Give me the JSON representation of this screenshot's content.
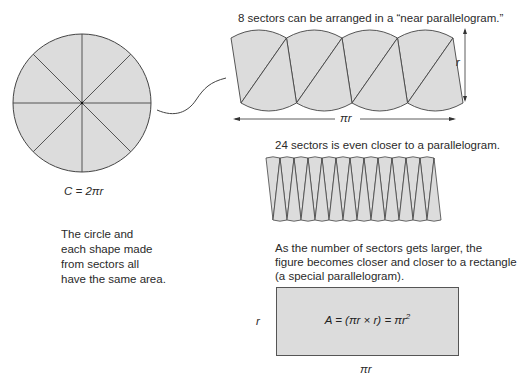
{
  "circle": {
    "sectors": 8,
    "formula": "C = 2πr"
  },
  "note": {
    "lines": [
      "The circle and",
      "each shape made",
      "from sectors all",
      "have the same area."
    ]
  },
  "eight_sector": {
    "caption": "8 sectors can be arranged in a “near parallelogram.”",
    "sectors": 8,
    "height_label": "r",
    "width_label": "πr"
  },
  "twentyfour_sector": {
    "caption": "24 sectors is even closer to a parallelogram.",
    "sectors": 24
  },
  "rectangle": {
    "caption_lines": [
      "As the number of sectors gets larger, the",
      "figure becomes closer and closer to a rectangle",
      "(a special parallelogram)."
    ],
    "height_label": "r",
    "width_label": "πr",
    "formula_main": "A = (πr × r) = πr",
    "formula_exp": "2"
  },
  "colors": {
    "fill": "#dcdcdc",
    "stroke": "#444444"
  }
}
